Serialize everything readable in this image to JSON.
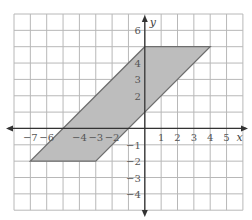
{
  "chart_data": {
    "type": "coordinate-grid",
    "title": "",
    "xlabel": "x",
    "ylabel": "y",
    "grid": true,
    "xlim": [
      -8,
      6
    ],
    "ylim": [
      -5,
      7
    ],
    "x_ticks": [
      -7,
      -6,
      -4,
      -3,
      -2,
      1,
      2,
      3,
      4,
      5
    ],
    "y_ticks": [
      6,
      4,
      3,
      2,
      -1,
      -2,
      -3,
      -4
    ],
    "shapes": [
      {
        "type": "parallelogram",
        "fill": "#bdbdbd",
        "stroke": "#6e6e6e",
        "vertices": [
          [
            -7,
            -2
          ],
          [
            -3,
            -2
          ],
          [
            4,
            5
          ],
          [
            0,
            5
          ]
        ]
      }
    ]
  },
  "colors": {
    "grid": "#b8b8b8",
    "axis": "#333333",
    "fill": "#bdbdbd",
    "stroke": "#6e6e6e"
  }
}
